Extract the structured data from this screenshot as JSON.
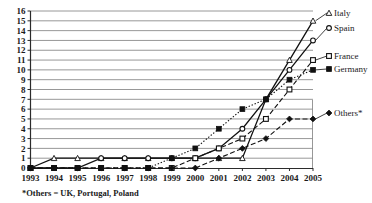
{
  "chart_data": {
    "type": "line",
    "title": "",
    "xlabel": "",
    "ylabel": "",
    "x": [
      "1993",
      "1994",
      "1995",
      "1996",
      "1997",
      "1998",
      "1999",
      "2000",
      "2001",
      "2002",
      "2003",
      "2004",
      "2005"
    ],
    "categories": [
      "1993",
      "1994",
      "1995",
      "1996",
      "1997",
      "1998",
      "1999",
      "2000",
      "2001",
      "2002",
      "2003",
      "2004",
      "2005"
    ],
    "ylim": [
      0,
      16
    ],
    "yticks": [
      0,
      1,
      2,
      3,
      4,
      5,
      6,
      7,
      8,
      9,
      10,
      11,
      12,
      13,
      14,
      15,
      16
    ],
    "grid": true,
    "legend_position": "right-inline",
    "series": [
      {
        "name": "Italy",
        "marker": "triangle-open",
        "line_style": "solid",
        "values": [
          0,
          1,
          1,
          1,
          1,
          1,
          1,
          1,
          1,
          1,
          7,
          11,
          15
        ]
      },
      {
        "name": "Spain",
        "marker": "circle-open",
        "line_style": "solid",
        "values": [
          0,
          0,
          0,
          1,
          1,
          1,
          1,
          1,
          2,
          4,
          7,
          10,
          13
        ]
      },
      {
        "name": "France",
        "marker": "square-open",
        "line_style": "dashed",
        "values": [
          0,
          0,
          0,
          0,
          0,
          0,
          0,
          1,
          2,
          3,
          5,
          8,
          11
        ]
      },
      {
        "name": "Germany",
        "marker": "square-filled",
        "line_style": "dotted",
        "values": [
          0,
          0,
          0,
          0,
          0,
          0,
          1,
          2,
          4,
          6,
          7,
          9,
          10
        ]
      },
      {
        "name": "Others*",
        "marker": "diamond-filled",
        "line_style": "dashed",
        "values": [
          0,
          0,
          0,
          0,
          0,
          0,
          0,
          0,
          1,
          2,
          3,
          5,
          5
        ]
      }
    ],
    "annotations": [
      {
        "text": "*Others = UK, Portugal, Poland"
      }
    ]
  },
  "labels": {
    "series_italy": "Italy",
    "series_spain": "Spain",
    "series_france": "France",
    "series_germany": "Germany",
    "series_others": "Others*",
    "footnote": "*Others = UK, Portugal, Poland"
  },
  "yticks": {
    "t0": "0",
    "t1": "1",
    "t2": "2",
    "t3": "3",
    "t4": "4",
    "t5": "5",
    "t6": "6",
    "t7": "7",
    "t8": "8",
    "t9": "9",
    "t10": "10",
    "t11": "11",
    "t12": "12",
    "t13": "13",
    "t14": "14",
    "t15": "15",
    "t16": "16"
  },
  "xticks": {
    "x0": "1993",
    "x1": "1994",
    "x2": "1995",
    "x3": "1996",
    "x4": "1997",
    "x5": "1998",
    "x6": "1999",
    "x7": "2000",
    "x8": "2001",
    "x9": "2002",
    "x10": "2003",
    "x11": "2004",
    "x12": "2005"
  },
  "colors": {
    "ink": "#111111",
    "grid": "#8c8c8c",
    "axis": "#2b2b2b",
    "background": "#ffffff"
  }
}
